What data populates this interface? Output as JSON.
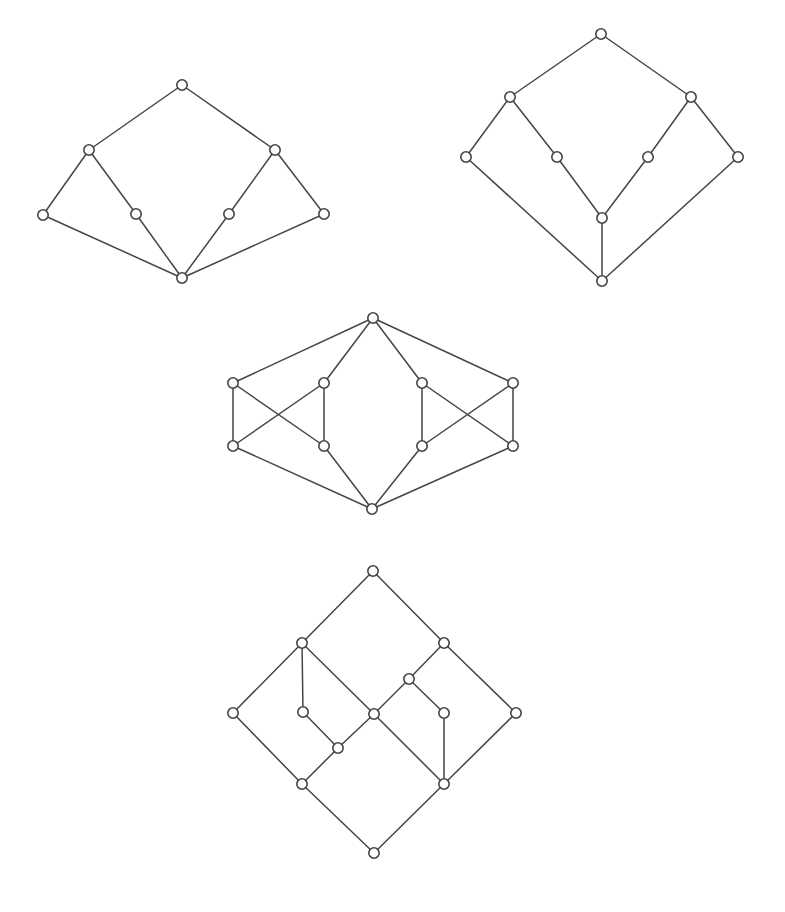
{
  "page": {
    "background_color": "#ffffff",
    "width": 785,
    "height": 912
  },
  "style": {
    "edge_color": "#454545",
    "edge_width": 1.5,
    "node_fill": "#ffffff",
    "node_stroke": "#454545",
    "node_stroke_width": 1.6,
    "node_radius": 5.2
  },
  "diagrams": [
    {
      "id": "diagram-1",
      "label": "lattice-top-left",
      "node_count": 8,
      "edge_count": 8,
      "nodes": [
        {
          "id": "d1-n0",
          "name": "top",
          "x": 182,
          "y": 85
        },
        {
          "id": "d1-n1",
          "name": "upper-left",
          "x": 89,
          "y": 150
        },
        {
          "id": "d1-n2",
          "name": "upper-right",
          "x": 275,
          "y": 150
        },
        {
          "id": "d1-n3",
          "name": "far-left",
          "x": 43,
          "y": 215
        },
        {
          "id": "d1-n4",
          "name": "mid-left",
          "x": 136,
          "y": 214
        },
        {
          "id": "d1-n5",
          "name": "mid-right",
          "x": 229,
          "y": 214
        },
        {
          "id": "d1-n6",
          "name": "far-right",
          "x": 324,
          "y": 214
        },
        {
          "id": "d1-n7",
          "name": "bottom",
          "x": 182,
          "y": 278
        }
      ],
      "edges": [
        {
          "from": "d1-n0",
          "to": "d1-n1"
        },
        {
          "from": "d1-n0",
          "to": "d1-n2"
        },
        {
          "from": "d1-n1",
          "to": "d1-n3"
        },
        {
          "from": "d1-n1",
          "to": "d1-n4"
        },
        {
          "from": "d1-n2",
          "to": "d1-n5"
        },
        {
          "from": "d1-n2",
          "to": "d1-n6"
        },
        {
          "from": "d1-n3",
          "to": "d1-n7"
        },
        {
          "from": "d1-n4",
          "to": "d1-n7"
        },
        {
          "from": "d1-n5",
          "to": "d1-n7"
        },
        {
          "from": "d1-n6",
          "to": "d1-n7"
        }
      ]
    },
    {
      "id": "diagram-2",
      "label": "lattice-top-right",
      "node_count": 9,
      "edge_count": 10,
      "nodes": [
        {
          "id": "d2-n0",
          "name": "top",
          "x": 601,
          "y": 34
        },
        {
          "id": "d2-n1",
          "name": "upper-left",
          "x": 510,
          "y": 97
        },
        {
          "id": "d2-n2",
          "name": "upper-right",
          "x": 691,
          "y": 97
        },
        {
          "id": "d2-n3",
          "name": "far-left",
          "x": 466,
          "y": 157
        },
        {
          "id": "d2-n4",
          "name": "mid-left",
          "x": 557,
          "y": 157
        },
        {
          "id": "d2-n5",
          "name": "mid-right",
          "x": 648,
          "y": 157
        },
        {
          "id": "d2-n6",
          "name": "far-right",
          "x": 738,
          "y": 157
        },
        {
          "id": "d2-n7",
          "name": "center",
          "x": 602,
          "y": 218
        },
        {
          "id": "d2-n8",
          "name": "bottom",
          "x": 602,
          "y": 281
        }
      ],
      "edges": [
        {
          "from": "d2-n0",
          "to": "d2-n1"
        },
        {
          "from": "d2-n0",
          "to": "d2-n2"
        },
        {
          "from": "d2-n1",
          "to": "d2-n3"
        },
        {
          "from": "d2-n1",
          "to": "d2-n4"
        },
        {
          "from": "d2-n2",
          "to": "d2-n5"
        },
        {
          "from": "d2-n2",
          "to": "d2-n6"
        },
        {
          "from": "d2-n4",
          "to": "d2-n7"
        },
        {
          "from": "d2-n5",
          "to": "d2-n7"
        },
        {
          "from": "d2-n7",
          "to": "d2-n8"
        },
        {
          "from": "d2-n3",
          "to": "d2-n8"
        },
        {
          "from": "d2-n6",
          "to": "d2-n8"
        }
      ]
    },
    {
      "id": "diagram-3",
      "label": "lattice-middle",
      "node_count": 10,
      "edge_count": 16,
      "nodes": [
        {
          "id": "d3-n0",
          "name": "top",
          "x": 373,
          "y": 318
        },
        {
          "id": "d3-n1",
          "name": "outer-left-upper",
          "x": 233,
          "y": 383
        },
        {
          "id": "d3-n2",
          "name": "inner-left-upper",
          "x": 324,
          "y": 383
        },
        {
          "id": "d3-n3",
          "name": "inner-right-upper",
          "x": 422,
          "y": 383
        },
        {
          "id": "d3-n4",
          "name": "outer-right-upper",
          "x": 513,
          "y": 383
        },
        {
          "id": "d3-n5",
          "name": "outer-left-lower",
          "x": 233,
          "y": 446
        },
        {
          "id": "d3-n6",
          "name": "inner-left-lower",
          "x": 324,
          "y": 446
        },
        {
          "id": "d3-n7",
          "name": "inner-right-lower",
          "x": 422,
          "y": 446
        },
        {
          "id": "d3-n8",
          "name": "outer-right-lower",
          "x": 513,
          "y": 446
        },
        {
          "id": "d3-n9",
          "name": "bottom",
          "x": 372,
          "y": 509
        }
      ],
      "edges": [
        {
          "from": "d3-n0",
          "to": "d3-n1"
        },
        {
          "from": "d3-n0",
          "to": "d3-n2"
        },
        {
          "from": "d3-n0",
          "to": "d3-n3"
        },
        {
          "from": "d3-n0",
          "to": "d3-n4"
        },
        {
          "from": "d3-n1",
          "to": "d3-n5"
        },
        {
          "from": "d3-n1",
          "to": "d3-n6"
        },
        {
          "from": "d3-n2",
          "to": "d3-n5"
        },
        {
          "from": "d3-n2",
          "to": "d3-n6"
        },
        {
          "from": "d3-n3",
          "to": "d3-n7"
        },
        {
          "from": "d3-n3",
          "to": "d3-n8"
        },
        {
          "from": "d3-n4",
          "to": "d3-n7"
        },
        {
          "from": "d3-n4",
          "to": "d3-n8"
        },
        {
          "from": "d3-n5",
          "to": "d3-n9"
        },
        {
          "from": "d3-n6",
          "to": "d3-n9"
        },
        {
          "from": "d3-n7",
          "to": "d3-n9"
        },
        {
          "from": "d3-n8",
          "to": "d3-n9"
        }
      ]
    },
    {
      "id": "diagram-4",
      "label": "lattice-bottom",
      "node_count": 13,
      "edge_count": 16,
      "nodes": [
        {
          "id": "d4-n0",
          "name": "top",
          "x": 373,
          "y": 571
        },
        {
          "id": "d4-n1",
          "name": "upper-left",
          "x": 302,
          "y": 643
        },
        {
          "id": "d4-n2",
          "name": "upper-right",
          "x": 444,
          "y": 643
        },
        {
          "id": "d4-n3",
          "name": "right-branch-upper",
          "x": 409,
          "y": 679
        },
        {
          "id": "d4-n4",
          "name": "far-left",
          "x": 233,
          "y": 713
        },
        {
          "id": "d4-n5",
          "name": "left-branch-mid",
          "x": 303,
          "y": 712
        },
        {
          "id": "d4-n6",
          "name": "center",
          "x": 374,
          "y": 714
        },
        {
          "id": "d4-n7",
          "name": "right-branch-mid",
          "x": 444,
          "y": 713
        },
        {
          "id": "d4-n8",
          "name": "far-right",
          "x": 516,
          "y": 713
        },
        {
          "id": "d4-n9",
          "name": "left-branch-lower",
          "x": 338,
          "y": 748
        },
        {
          "id": "d4-n10",
          "name": "lower-left",
          "x": 302,
          "y": 784
        },
        {
          "id": "d4-n11",
          "name": "lower-right",
          "x": 444,
          "y": 784
        },
        {
          "id": "d4-n12",
          "name": "bottom",
          "x": 374,
          "y": 853
        }
      ],
      "edges": [
        {
          "from": "d4-n0",
          "to": "d4-n1"
        },
        {
          "from": "d4-n0",
          "to": "d4-n2"
        },
        {
          "from": "d4-n1",
          "to": "d4-n4"
        },
        {
          "from": "d4-n1",
          "to": "d4-n5"
        },
        {
          "from": "d4-n1",
          "to": "d4-n6"
        },
        {
          "from": "d4-n2",
          "to": "d4-n3"
        },
        {
          "from": "d4-n2",
          "to": "d4-n8"
        },
        {
          "from": "d4-n3",
          "to": "d4-n6"
        },
        {
          "from": "d4-n3",
          "to": "d4-n7"
        },
        {
          "from": "d4-n4",
          "to": "d4-n10"
        },
        {
          "from": "d4-n5",
          "to": "d4-n9"
        },
        {
          "from": "d4-n6",
          "to": "d4-n9"
        },
        {
          "from": "d4-n6",
          "to": "d4-n11"
        },
        {
          "from": "d4-n7",
          "to": "d4-n11"
        },
        {
          "from": "d4-n8",
          "to": "d4-n11"
        },
        {
          "from": "d4-n9",
          "to": "d4-n10"
        },
        {
          "from": "d4-n10",
          "to": "d4-n12"
        },
        {
          "from": "d4-n11",
          "to": "d4-n12"
        }
      ]
    }
  ]
}
